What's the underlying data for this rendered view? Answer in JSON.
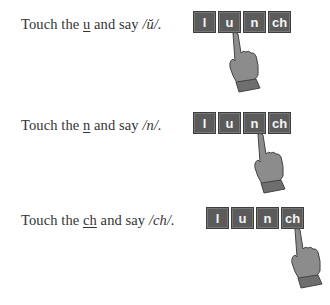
{
  "rows": [
    {
      "instruction": {
        "prefix": "Touch the ",
        "target": "u",
        "middle": " and say ",
        "sound": "/ŭ/."
      },
      "tiles": [
        "l",
        "u",
        "n",
        "ch"
      ],
      "touched_index": 1
    },
    {
      "instruction": {
        "prefix": "Touch the ",
        "target": "n",
        "middle": " and say ",
        "sound": "/n/."
      },
      "tiles": [
        "l",
        "u",
        "n",
        "ch"
      ],
      "touched_index": 2
    },
    {
      "instruction": {
        "prefix": "Touch the ",
        "target": "ch",
        "middle": " and say ",
        "sound": "/ch/."
      },
      "tiles": [
        "l",
        "u",
        "n",
        "ch"
      ],
      "touched_index": 3
    }
  ],
  "colors": {
    "tile": "#5b5b5b",
    "tile_text": "#f4f4f4",
    "hand": "#8c8c8c",
    "text": "#333333"
  }
}
